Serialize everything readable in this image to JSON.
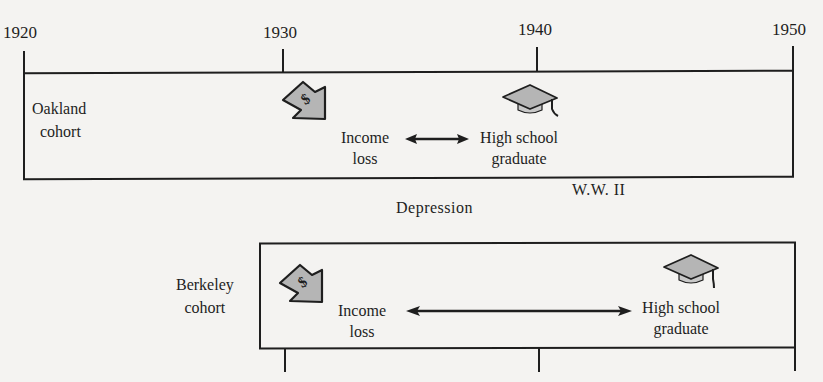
{
  "timeline": {
    "years": [
      "1920",
      "1930",
      "1940",
      "1950"
    ]
  },
  "cohorts": [
    {
      "name": "Oakland cohort",
      "name_line1": "Oakland",
      "name_line2": "cohort",
      "event1": {
        "icon": "falling-dollar-arrow-icon",
        "line1": "Income",
        "line2": "loss"
      },
      "event2": {
        "icon": "graduation-cap-icon",
        "line1": "High school",
        "line2": "graduate"
      }
    },
    {
      "name": "Berkeley cohort",
      "name_line1": "Berkeley",
      "name_line2": "cohort",
      "event1": {
        "icon": "falling-dollar-arrow-icon",
        "line1": "Income",
        "line2": "loss"
      },
      "event2": {
        "icon": "graduation-cap-icon",
        "line1": "High school",
        "line2": "graduate"
      }
    }
  ],
  "eras": {
    "ww2": "W.W. II",
    "depression": "Depression"
  },
  "colors": {
    "ink": "#1e1e1e",
    "icon_fill": "#b5b5b5",
    "background": "#f4f3f1"
  }
}
